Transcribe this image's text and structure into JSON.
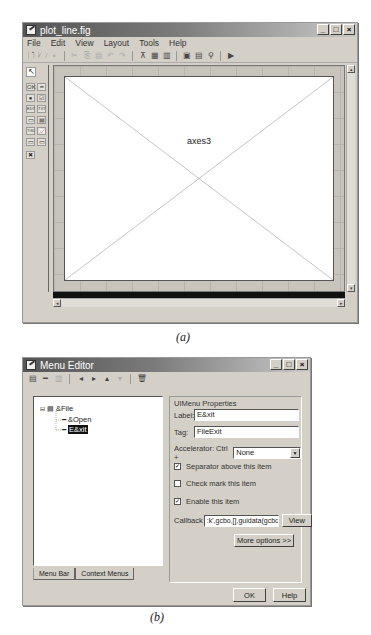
{
  "figure_a": {
    "window": {
      "title": "plot_line.fig",
      "buttons": {
        "minimize": "_",
        "maximize": "□",
        "close": "×"
      }
    },
    "menubar": [
      {
        "label": "File",
        "mnemonic": "F"
      },
      {
        "label": "Edit",
        "mnemonic": "E"
      },
      {
        "label": "View",
        "mnemonic": "V"
      },
      {
        "label": "Layout",
        "mnemonic": "L"
      },
      {
        "label": "Tools",
        "mnemonic": "T"
      },
      {
        "label": "Help",
        "mnemonic": "H"
      }
    ],
    "toolbar": {
      "icons": [
        "new-icon",
        "open-icon",
        "save-icon",
        "cut-icon",
        "copy-icon",
        "paste-icon",
        "undo-icon",
        "redo-icon",
        "align-icon",
        "menu-editor-icon",
        "tab-order-icon",
        "m-file-editor-icon",
        "property-inspector-icon",
        "object-browser-icon",
        "run-icon"
      ],
      "glyphs": [
        "🗋",
        "🗁",
        "▪",
        "✂",
        "⎘",
        "▤",
        "↶",
        "↷",
        "⊼",
        "▦",
        "▥",
        "▣",
        "▤",
        "⚲",
        "▶"
      ]
    },
    "palette": {
      "items": [
        {
          "name": "select-tool",
          "glyph": "↖"
        },
        {
          "name": "push-button-tool",
          "glyph": "OK"
        },
        {
          "name": "slider-tool",
          "glyph": "━"
        },
        {
          "name": "radio-button-tool",
          "glyph": "●"
        },
        {
          "name": "check-box-tool",
          "glyph": "☑"
        },
        {
          "name": "edit-text-tool",
          "glyph": "EDT"
        },
        {
          "name": "static-text-tool",
          "glyph": "TXT"
        },
        {
          "name": "popup-menu-tool",
          "glyph": "▭"
        },
        {
          "name": "listbox-tool",
          "glyph": "▤"
        },
        {
          "name": "toggle-button-tool",
          "glyph": "TGL"
        },
        {
          "name": "axes-tool",
          "glyph": "📈"
        },
        {
          "name": "panel-tool",
          "glyph": "▭"
        },
        {
          "name": "button-group-tool",
          "glyph": "▭"
        },
        {
          "name": "activex-tool",
          "glyph": "✖"
        }
      ]
    },
    "axes_label": "axes3",
    "caption": "(a)"
  },
  "figure_b": {
    "window": {
      "title": "Menu Editor",
      "buttons": {
        "minimize": "_",
        "maximize": "□",
        "close": "×"
      }
    },
    "toolbar": {
      "icons": [
        "new-menu-icon",
        "new-menu-item-icon",
        "new-context-menu-icon",
        "move-left-icon",
        "move-right-icon",
        "move-up-icon",
        "move-down-icon",
        "delete-icon"
      ],
      "glyphs": [
        "▤",
        "━",
        "▥",
        "◂",
        "▸",
        "▴",
        "▾",
        "🗑"
      ]
    },
    "tree": {
      "items": [
        {
          "label": "&File",
          "level": 0,
          "expanded": true
        },
        {
          "label": "&Open",
          "level": 1
        },
        {
          "label": "E&xit",
          "level": 1,
          "selected": true
        }
      ]
    },
    "tabs": [
      {
        "label": "Menu Bar",
        "active": true
      },
      {
        "label": "Context Menus",
        "active": false
      }
    ],
    "properties": {
      "group_title": "UIMenu Properties",
      "label_caption": "Label:",
      "label_value": "E&xit",
      "tag_caption": "Tag:",
      "tag_value": "FileExit",
      "accelerator_caption": "Accelerator: Ctrl +",
      "accelerator_value": "None",
      "separator_label": "Separator above this item",
      "separator_checked": true,
      "checkmark_label": "Check mark this item",
      "checkmark_checked": false,
      "enable_label": "Enable this item",
      "enable_checked": true,
      "callback_caption": "Callback",
      "callback_value": ":k',gcbo,[],guidata(gcbo))",
      "view_button": "View",
      "more_options_button": "More options >>"
    },
    "footer": {
      "ok_button": "OK",
      "help_button": "Help"
    },
    "caption": "(b)"
  }
}
